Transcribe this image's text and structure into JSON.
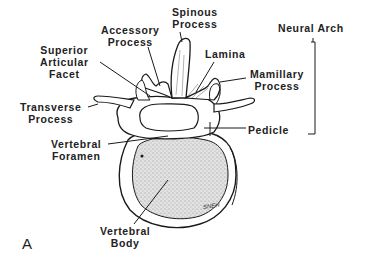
{
  "figure": {
    "panel_label": "A",
    "signature": "SNEH",
    "labels": {
      "spinous_process": "Spinous\nProcess",
      "accessory_process": "Accessory\nProcess",
      "superior_articular_facet": "Superior\nArticular\nFacet",
      "lamina": "Lamina",
      "mamillary_process": "Mamillary\nProcess",
      "transverse_process": "Transverse\nProcess",
      "pedicle": "Pedicle",
      "vertebral_foramen": "Vertebral\nForamen",
      "vertebral_body": "Vertebral\nBody",
      "neural_arch": "Neural Arch"
    },
    "colors": {
      "line": "#1a1a1a",
      "stipple": "#b8b8b8",
      "background": "#ffffff"
    }
  }
}
